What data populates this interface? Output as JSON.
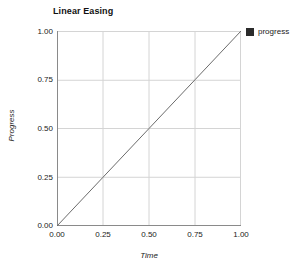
{
  "chart_data": {
    "type": "line",
    "title": "Linear Easing",
    "xlabel": "Time",
    "ylabel": "Progress",
    "xlim": [
      0,
      1
    ],
    "ylim": [
      0,
      1
    ],
    "grid": true,
    "legend_position": "top-right",
    "x_ticks": [
      "0.00",
      "0.25",
      "0.50",
      "0.75",
      "1.00"
    ],
    "y_ticks": [
      "1.00",
      "0.75",
      "0.50",
      "0.25",
      "0.00"
    ],
    "x_tick_values": [
      0,
      0.25,
      0.5,
      0.75,
      1
    ],
    "y_tick_values": [
      1,
      0.75,
      0.5,
      0.25,
      0
    ],
    "series": [
      {
        "name": "progress",
        "color": "#2b2b2b",
        "x": [
          0,
          0.25,
          0.5,
          0.75,
          1
        ],
        "values": [
          0,
          0.25,
          0.5,
          0.75,
          1
        ]
      }
    ],
    "legend": [
      {
        "label": "progress",
        "color": "#2b2b2b",
        "marker": "square"
      }
    ]
  },
  "colors": {
    "line": "#6b6b6b",
    "grid": "#d4d4d4",
    "axis": "#8a8a8a",
    "legend_swatch": "#2b2b2b",
    "text": "#222222",
    "background": "#ffffff"
  }
}
